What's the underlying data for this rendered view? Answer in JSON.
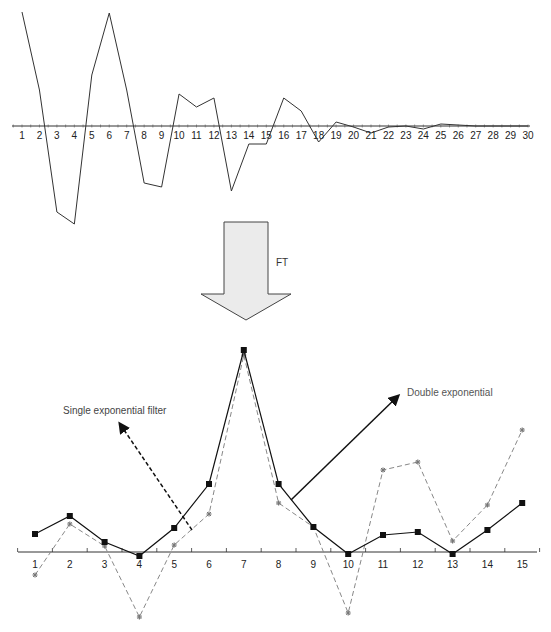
{
  "chart_data": [
    {
      "type": "line",
      "title": "",
      "xlabel": "",
      "ylabel": "",
      "grid": false,
      "x": [
        1,
        2,
        3,
        4,
        5,
        6,
        7,
        8,
        9,
        10,
        11,
        12,
        13,
        14,
        15,
        16,
        17,
        18,
        19,
        20,
        21,
        22,
        23,
        24,
        25,
        26,
        27,
        28,
        29,
        30
      ],
      "series": [
        {
          "name": "time-domain signal",
          "style": "solid",
          "color": "#333333",
          "values": [
            114,
            36,
            -86,
            -98,
            51,
            113,
            36,
            -57,
            -61,
            32,
            19,
            28,
            -65,
            -18,
            -18,
            28,
            15,
            -16,
            4,
            -1,
            -7,
            -1,
            0,
            -3,
            2,
            1,
            0,
            0,
            0,
            0
          ]
        }
      ],
      "axis_y_px": 126
    },
    {
      "type": "line",
      "title": "",
      "xlabel": "",
      "ylabel": "",
      "grid": false,
      "x": [
        1,
        2,
        3,
        4,
        5,
        6,
        7,
        8,
        9,
        10,
        11,
        12,
        13,
        14,
        15
      ],
      "series": [
        {
          "name": "Double exponential",
          "style": "solid",
          "marker": "square",
          "color": "#111111",
          "values": [
            18,
            36,
            10,
            -4,
            24,
            68,
            202,
            68,
            25,
            -2,
            17,
            20,
            -2,
            22,
            49
          ]
        },
        {
          "name": "Single exponential filter",
          "style": "dashed",
          "marker": "star",
          "color": "#777777",
          "values": [
            -23,
            28,
            6,
            -65,
            7,
            38,
            197,
            49,
            25,
            -61,
            82,
            90,
            11,
            47,
            122
          ]
        }
      ],
      "axis_y_px": 552
    }
  ],
  "top_chart": {
    "tick_labels": [
      "1",
      "2",
      "3",
      "4",
      "5",
      "6",
      "7",
      "8",
      "9",
      "10",
      "11",
      "12",
      "13",
      "14",
      "15",
      "16",
      "17",
      "18",
      "19",
      "20",
      "21",
      "22",
      "23",
      "24",
      "25",
      "26",
      "27",
      "28",
      "29",
      "30"
    ]
  },
  "transform_arrow": {
    "label": "FT",
    "fill": "#ebebeb",
    "stroke": "#333333"
  },
  "bottom_chart": {
    "tick_labels": [
      "1",
      "2",
      "3",
      "4",
      "5",
      "6",
      "7",
      "8",
      "9",
      "10",
      "11",
      "12",
      "13",
      "14",
      "15"
    ],
    "annotations": {
      "single": "Single exponential filter",
      "double": "Double exponential"
    }
  }
}
